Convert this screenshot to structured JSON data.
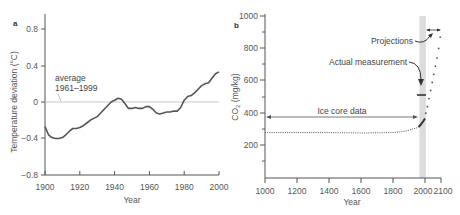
{
  "chart_data": [
    {
      "panel": "a",
      "type": "line",
      "title": "",
      "xlabel": "Year",
      "ylabel": "Temperature deviation (°C)",
      "xlim": [
        1900,
        2000
      ],
      "ylim": [
        -0.8,
        0.8
      ],
      "x_ticks": [
        "1900",
        "1920",
        "1940",
        "1960",
        "1980",
        "2000"
      ],
      "y_ticks": [
        "0.8",
        "0.4",
        "0",
        "−0.4",
        "−0.8"
      ],
      "grid": false,
      "reference_line": {
        "y": 0,
        "label_line1": "average",
        "label_line2": "1961–1999"
      },
      "series": [
        {
          "name": "Temperature deviation",
          "x": [
            1900,
            1902,
            1904,
            1906,
            1908,
            1910,
            1912,
            1914,
            1916,
            1918,
            1920,
            1922,
            1924,
            1926,
            1928,
            1930,
            1932,
            1934,
            1936,
            1938,
            1940,
            1942,
            1944,
            1946,
            1948,
            1950,
            1952,
            1954,
            1956,
            1958,
            1960,
            1962,
            1964,
            1966,
            1968,
            1970,
            1972,
            1974,
            1976,
            1978,
            1980,
            1982,
            1984,
            1986,
            1988,
            1990,
            1992,
            1994,
            1996,
            1998,
            2000
          ],
          "values": [
            -0.27,
            -0.36,
            -0.39,
            -0.4,
            -0.4,
            -0.39,
            -0.36,
            -0.32,
            -0.29,
            -0.29,
            -0.28,
            -0.26,
            -0.23,
            -0.2,
            -0.18,
            -0.16,
            -0.12,
            -0.08,
            -0.04,
            0.0,
            0.02,
            0.04,
            0.03,
            -0.02,
            -0.07,
            -0.07,
            -0.06,
            -0.07,
            -0.07,
            -0.05,
            -0.05,
            -0.08,
            -0.12,
            -0.13,
            -0.12,
            -0.11,
            -0.11,
            -0.1,
            -0.1,
            -0.06,
            0.02,
            0.06,
            0.07,
            0.1,
            0.14,
            0.18,
            0.2,
            0.21,
            0.26,
            0.31,
            0.33
          ]
        }
      ]
    },
    {
      "panel": "b",
      "type": "line",
      "title": "",
      "xlabel": "Year",
      "ylabel": "CO₂ (mg/kg)",
      "xlim": [
        1000,
        2100
      ],
      "ylim": [
        0,
        1000
      ],
      "x_ticks": [
        "1000",
        "1200",
        "1400",
        "1600",
        "1800",
        "2000",
        "2100"
      ],
      "y_ticks": [
        "1000",
        "800",
        "600",
        "400",
        "200"
      ],
      "grid": false,
      "shaded_band": {
        "x_start": 1965,
        "x_end": 2005
      },
      "series": [
        {
          "name": "Ice core data",
          "style": "dotted",
          "x": [
            1000,
            1200,
            1400,
            1600,
            1800,
            1850,
            1900,
            1930,
            1950,
            1960
          ],
          "values": [
            280,
            280,
            280,
            278,
            280,
            285,
            295,
            305,
            310,
            315
          ]
        },
        {
          "name": "Actual measurement",
          "style": "solid",
          "x": [
            1960,
            1970,
            1980,
            1990,
            2000
          ],
          "values": [
            315,
            325,
            338,
            352,
            368
          ]
        },
        {
          "name": "Projections",
          "style": "dotted",
          "x": [
            2005,
            2015,
            2025,
            2035,
            2045,
            2055,
            2065,
            2075,
            2085,
            2095
          ],
          "values": [
            400,
            440,
            490,
            540,
            590,
            640,
            690,
            740,
            800,
            870
          ]
        }
      ],
      "annotations": [
        {
          "text": "Ice core data",
          "x_from": 1000,
          "x_to": 1960,
          "y": 370,
          "arrow": "double"
        },
        {
          "text": "Actual measurement",
          "marker_y": 500,
          "marker_x": 1985
        },
        {
          "text": "Projections",
          "arrow_to": [
            2050,
            880
          ]
        }
      ]
    }
  ],
  "panel_a": {
    "label": "a",
    "ylabel": "Temperature deviation (°C)",
    "xlabel": "Year",
    "y_ticks": [
      "0.8",
      "0.4",
      "0",
      "−0.4",
      "−0.8"
    ],
    "x_ticks": [
      "1900",
      "1920",
      "1940",
      "1960",
      "1980",
      "2000"
    ],
    "avg_label_1": "average",
    "avg_label_2": "1961–1999"
  },
  "panel_b": {
    "label": "b",
    "ylabel": "CO",
    "ylabel_sub": "2",
    "ylabel_unit": " (mg/kg)",
    "xlabel": "Year",
    "y_ticks": [
      "1000",
      "800",
      "600",
      "400",
      "200"
    ],
    "x_ticks": [
      "1000",
      "1200",
      "1400",
      "1600",
      "1800",
      "2000",
      "2100"
    ],
    "annot_ice": "Ice core data",
    "annot_actual": "Actual measurement",
    "annot_proj": "Projections"
  },
  "colors": {
    "axis": "#555555",
    "line": "#555555",
    "refline": "#bbbbbb",
    "band": "#dcdcdc"
  }
}
